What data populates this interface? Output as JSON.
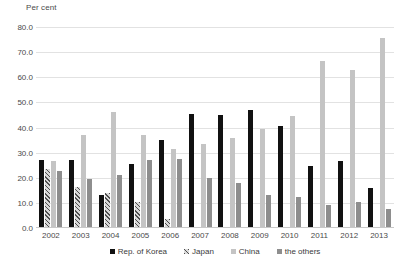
{
  "chart_data": {
    "type": "bar",
    "title": "",
    "subtitle": "",
    "xlabel": "",
    "ylabel": "Per cent",
    "ylim": [
      0,
      80
    ],
    "ytick_step": 10,
    "grid": true,
    "legend_position": "bottom",
    "categories": [
      "2002",
      "2003",
      "2004",
      "2005",
      "2006",
      "2007",
      "2008",
      "2009",
      "2010",
      "2011",
      "2012",
      "2013"
    ],
    "ytick_labels": [
      "80.0",
      "70.0",
      "60.0",
      "50.0",
      "40.0",
      "30.0",
      "20.0",
      "10.0",
      "0.0"
    ],
    "series": [
      {
        "name": "Rep. of Korea",
        "color": "#111111",
        "pattern": "solid",
        "values": [
          27.0,
          27.0,
          13.0,
          25.5,
          35.0,
          45.5,
          45.0,
          47.0,
          40.5,
          24.5,
          26.5,
          16.0
        ]
      },
      {
        "name": "Japan",
        "color": "#d8d8d8",
        "pattern": "hatched",
        "values": [
          23.5,
          16.5,
          14.0,
          10.5,
          3.5,
          0.0,
          0.0,
          0.0,
          0.0,
          0.0,
          0.0,
          0.0
        ]
      },
      {
        "name": "China",
        "color": "#c4c4c4",
        "pattern": "solid",
        "values": [
          26.5,
          37.0,
          46.0,
          37.0,
          31.5,
          33.5,
          36.0,
          39.5,
          44.5,
          66.5,
          63.0,
          75.5
        ]
      },
      {
        "name": "the others",
        "color": "#8e8e8e",
        "pattern": "solid",
        "values": [
          22.5,
          19.5,
          21.0,
          27.0,
          27.5,
          20.0,
          18.0,
          13.0,
          12.5,
          9.0,
          10.5,
          7.5
        ]
      }
    ]
  },
  "axis": {
    "y_title": "Per cent"
  },
  "legend": {
    "items": [
      {
        "label": "Rep. of Korea"
      },
      {
        "label": "Japan"
      },
      {
        "label": "China"
      },
      {
        "label": "the others"
      }
    ]
  }
}
